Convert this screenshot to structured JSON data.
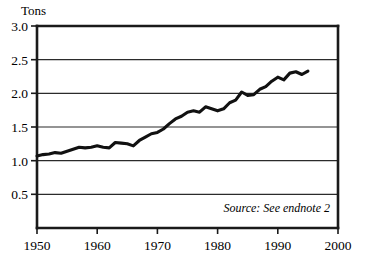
{
  "chart_data": {
    "type": "line",
    "title": "",
    "subtitle": "",
    "xlabel": "",
    "ylabel": "Tons",
    "xlim": [
      1950,
      2000
    ],
    "ylim": [
      0.0,
      3.0
    ],
    "grid": true,
    "grid_axis": "y",
    "legend": "none",
    "annotations": [
      "Source: See endnote 2"
    ],
    "xticks": [
      1950,
      1960,
      1970,
      1980,
      1990,
      2000
    ],
    "xtick_labels": [
      "1950",
      "1960",
      "1970",
      "1980",
      "1990",
      "2000"
    ],
    "yticks": [
      0.5,
      1.0,
      1.5,
      2.0,
      2.5,
      3.0
    ],
    "ytick_labels": [
      "0.5",
      "1.0",
      "1.5",
      "2.0",
      "2.5",
      "3.0"
    ],
    "line_color": "#111111",
    "series": [
      {
        "name": "Tons",
        "x": [
          1950,
          1951,
          1952,
          1953,
          1954,
          1955,
          1956,
          1957,
          1958,
          1959,
          1960,
          1961,
          1962,
          1963,
          1964,
          1965,
          1966,
          1967,
          1968,
          1969,
          1970,
          1971,
          1972,
          1973,
          1974,
          1975,
          1976,
          1977,
          1978,
          1979,
          1980,
          1981,
          1982,
          1983,
          1984,
          1985,
          1986,
          1987,
          1988,
          1989,
          1990,
          1991,
          1992,
          1993,
          1994,
          1995
        ],
        "values": [
          1.07,
          1.09,
          1.1,
          1.12,
          1.11,
          1.14,
          1.17,
          1.2,
          1.19,
          1.2,
          1.22,
          1.2,
          1.19,
          1.27,
          1.26,
          1.25,
          1.22,
          1.3,
          1.35,
          1.4,
          1.42,
          1.47,
          1.55,
          1.62,
          1.66,
          1.72,
          1.74,
          1.72,
          1.8,
          1.77,
          1.74,
          1.77,
          1.86,
          1.9,
          2.02,
          1.97,
          1.98,
          2.06,
          2.1,
          2.18,
          2.24,
          2.2,
          2.3,
          2.32,
          2.28,
          2.33
        ]
      }
    ]
  },
  "axis": {
    "y_label": "Tons",
    "x_tick_1": "1950",
    "x_tick_2": "1960",
    "x_tick_3": "1970",
    "x_tick_4": "1980",
    "x_tick_5": "1990",
    "x_tick_6": "2000",
    "y_tick_1": "0.5",
    "y_tick_2": "1.0",
    "y_tick_3": "1.5",
    "y_tick_4": "2.0",
    "y_tick_5": "2.5",
    "y_tick_6": "3.0"
  },
  "source": {
    "note": "Source: See endnote 2"
  }
}
